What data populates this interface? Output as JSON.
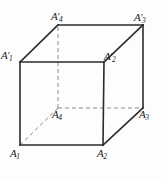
{
  "figure": {
    "kind": "cube-diagram",
    "stroke_color": "#2b2b2b",
    "hidden_stroke_color": "#8a8a8a",
    "background_color": "#fdfdfd",
    "width": 161,
    "height": 179
  },
  "vertices": {
    "a1": {
      "label_base": "A",
      "sub": "1",
      "prime": "",
      "x": 20,
      "y": 145
    },
    "a2": {
      "label_base": "A",
      "sub": "2",
      "prime": "",
      "x": 103,
      "y": 145
    },
    "a3": {
      "label_base": "A",
      "sub": "3",
      "prime": "",
      "x": 143,
      "y": 108
    },
    "a4": {
      "label_base": "A",
      "sub": "4",
      "prime": "",
      "x": 58,
      "y": 108
    },
    "a1p": {
      "label_base": "A",
      "sub": "1",
      "prime": "′",
      "x": 20,
      "y": 62
    },
    "a2p": {
      "label_base": "A",
      "sub": "2",
      "prime": "′",
      "x": 104,
      "y": 62
    },
    "a3p": {
      "label_base": "A",
      "sub": "3",
      "prime": "′",
      "x": 143,
      "y": 25
    },
    "a4p": {
      "label_base": "A",
      "sub": "4",
      "prime": "′",
      "x": 58,
      "y": 25
    }
  },
  "edges": {
    "visible": [
      {
        "from": "a1",
        "to": "a2"
      },
      {
        "from": "a2",
        "to": "a2p"
      },
      {
        "from": "a2p",
        "to": "a1p"
      },
      {
        "from": "a1p",
        "to": "a1"
      },
      {
        "from": "a1p",
        "to": "a4p"
      },
      {
        "from": "a2p",
        "to": "a3p"
      },
      {
        "from": "a4p",
        "to": "a3p"
      },
      {
        "from": "a3p",
        "to": "a3"
      },
      {
        "from": "a2",
        "to": "a3"
      }
    ],
    "hidden": [
      {
        "from": "a4",
        "to": "a1"
      },
      {
        "from": "a4",
        "to": "a3"
      },
      {
        "from": "a4",
        "to": "a4p"
      }
    ]
  }
}
